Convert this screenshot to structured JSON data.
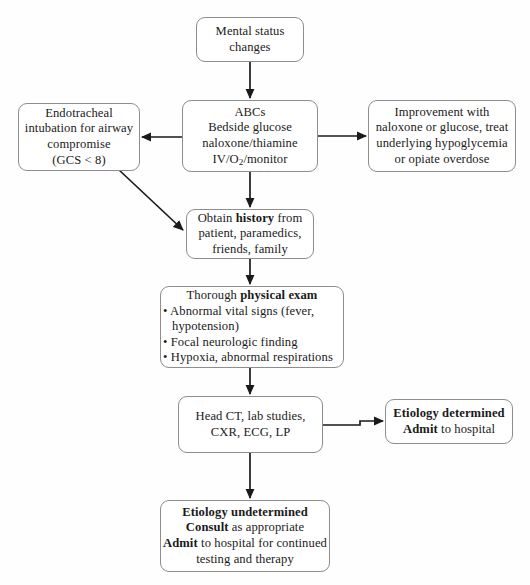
{
  "diagram": {
    "type": "flowchart",
    "stroke_color": "#1a1a1a",
    "box_border_color": "#8d8d8d",
    "background_color": "#ffffff"
  },
  "nodes": {
    "mental_status": {
      "id": "mental-status-changes",
      "lines": [
        "Mental status",
        "changes"
      ]
    },
    "abcs": {
      "id": "abcs-initial-management",
      "lines": [
        "ABCs",
        "Bedside glucose",
        "naloxone/thiamine"
      ],
      "line_iv_prefix": "IV/O",
      "line_iv_sub": "2",
      "line_iv_suffix": "/monitor"
    },
    "intubation": {
      "id": "endotracheal-intubation",
      "lines": [
        "Endotracheal",
        "intubation for airway",
        "compromise",
        "(GCS < 8)"
      ]
    },
    "improvement": {
      "id": "improvement-with-naloxone-or-glucose",
      "lines": [
        "Improvement with",
        "naloxone or glucose, treat",
        "underlying hypoglycemia",
        "or opiate overdose"
      ]
    },
    "history": {
      "id": "obtain-history",
      "line1_pre": "Obtain ",
      "line1_bold": "history",
      "line1_post": " from",
      "lines": [
        "patient, paramedics,",
        "friends, family"
      ]
    },
    "physical_exam": {
      "id": "thorough-physical-exam",
      "heading_pre": "Thorough ",
      "heading_bold": "physical exam",
      "bullets": [
        "• Abnormal vital signs (fever, hypotension)",
        "• Focal neurologic finding",
        "• Hypoxia, abnormal respirations"
      ]
    },
    "workup": {
      "id": "head-ct-lab-studies",
      "lines": [
        "Head CT, lab studies,",
        "CXR, ECG, LP"
      ]
    },
    "etiology_determined": {
      "id": "etiology-determined",
      "line1_bold": "Etiology determined",
      "line2_bold": "Admit",
      "line2_rest": " to hospital"
    },
    "etiology_undetermined": {
      "id": "etiology-undetermined",
      "line1_bold": "Etiology undetermined",
      "line2_bold": "Consult",
      "line2_rest": " as appropriate",
      "line3_bold": "Admit",
      "line3_rest": " to hospital for continued",
      "line4": "testing and therapy"
    }
  },
  "edges": [
    {
      "id": "edge-mental-to-abcs",
      "from": "mental_status",
      "to": "abcs",
      "style": "vertical-arrow"
    },
    {
      "id": "edge-abcs-to-intubation",
      "from": "abcs",
      "to": "intubation",
      "style": "horizontal-arrow-left"
    },
    {
      "id": "edge-abcs-to-improvement",
      "from": "abcs",
      "to": "improvement",
      "style": "horizontal-arrow-right"
    },
    {
      "id": "edge-abcs-to-history",
      "from": "abcs",
      "to": "history",
      "style": "vertical-arrow"
    },
    {
      "id": "edge-intubation-to-history",
      "from": "intubation",
      "to": "history",
      "style": "diagonal-arrow"
    },
    {
      "id": "edge-history-to-exam",
      "from": "history",
      "to": "physical_exam",
      "style": "vertical-arrow"
    },
    {
      "id": "edge-exam-to-workup",
      "from": "physical_exam",
      "to": "workup",
      "style": "vertical-arrow"
    },
    {
      "id": "edge-workup-to-determined",
      "from": "workup",
      "to": "etiology_determined",
      "style": "horizontal-arrow-right"
    },
    {
      "id": "edge-workup-to-undetermined",
      "from": "workup",
      "to": "etiology_undetermined",
      "style": "vertical-arrow"
    }
  ]
}
